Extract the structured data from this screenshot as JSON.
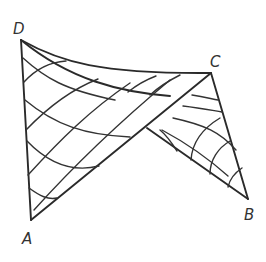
{
  "figure": {
    "stroke_color": "#2a2a2a",
    "background": "#ffffff"
  },
  "vertices": [
    {
      "id": "D",
      "label": "D",
      "x": 21,
      "y": 40,
      "label_x": 13,
      "label_y": 22
    },
    {
      "id": "C",
      "label": "C",
      "x": 211,
      "y": 73,
      "label_x": 210,
      "label_y": 55
    },
    {
      "id": "A",
      "label": "A",
      "x": 31,
      "y": 220,
      "label_x": 22,
      "label_y": 232
    },
    {
      "id": "B",
      "label": "B",
      "x": 248,
      "y": 199,
      "label_x": 244,
      "label_y": 208
    }
  ]
}
